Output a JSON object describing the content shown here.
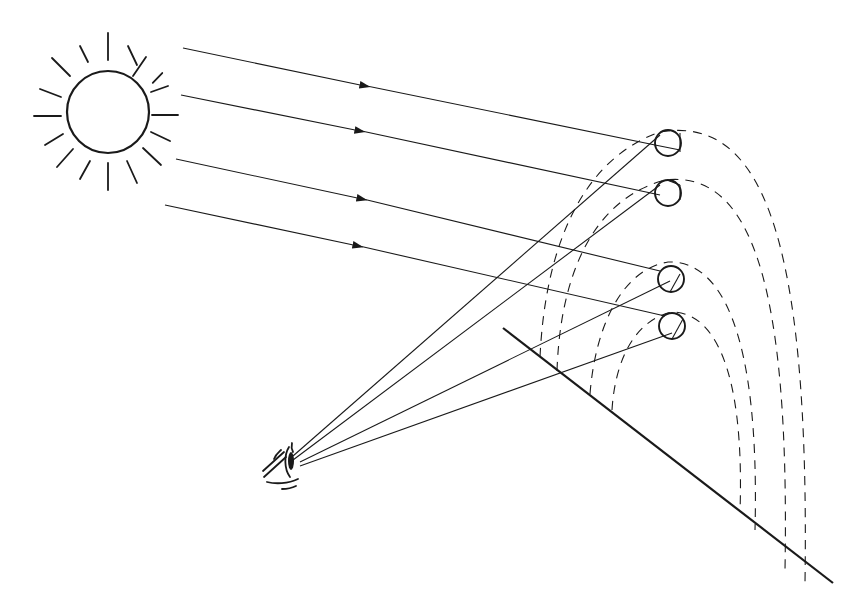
{
  "diagram": {
    "type": "rainbow-formation-illustration",
    "elements": [
      "sun",
      "sun-rays",
      "incoming-light-beams",
      "raindrops",
      "lines-of-sight",
      "observer-eye",
      "ground-line",
      "rainbow-arcs"
    ],
    "counts": {
      "incoming_beams": 4,
      "raindrops": 4,
      "lines_of_sight": 4,
      "dashed_rainbow_arcs": 4,
      "sun_rays": 16
    },
    "labels": [],
    "colors": {
      "ink": "#1a1a1a",
      "background": "#ffffff"
    }
  }
}
